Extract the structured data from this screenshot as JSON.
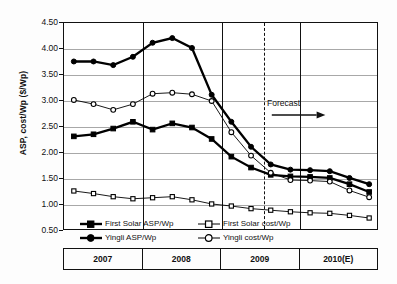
{
  "chart_data": {
    "type": "line",
    "title": "",
    "xlabel": "",
    "ylabel": "ASP, cost/Wp ($/Wp)",
    "ylim": [
      0.5,
      4.5
    ],
    "ytick_labels": [
      "0.50",
      "1.00",
      "1.50",
      "2.00",
      "2.50",
      "3.00",
      "3.50",
      "4.00",
      "4.50"
    ],
    "ytick_values": [
      0.5,
      1.0,
      1.5,
      2.0,
      2.5,
      3.0,
      3.5,
      4.0,
      4.5
    ],
    "grid": true,
    "legend_position": "bottom-inside",
    "x_group_labels": [
      "2007",
      "2008",
      "2009",
      "2010(E)"
    ],
    "x": [
      "2007Q1",
      "2007Q2",
      "2007Q3",
      "2007Q4",
      "2008Q1",
      "2008Q2",
      "2008Q3",
      "2008Q4",
      "2009Q1",
      "2009Q2",
      "2009Q3",
      "2009Q4",
      "2010Q1",
      "2010Q2",
      "2010Q3",
      "2010Q4"
    ],
    "annotations": [
      {
        "text": "Forecast",
        "type": "forecast-divider-arrow",
        "at_x": "2009Q4/2010Q1 boundary"
      }
    ],
    "series": [
      {
        "name": "First Solar ASP/Wp",
        "marker": "filled-square",
        "line": "thick-solid",
        "color": "#000000",
        "values": [
          2.32,
          2.36,
          2.47,
          2.6,
          2.45,
          2.57,
          2.49,
          2.27,
          1.93,
          1.72,
          1.58,
          1.55,
          1.54,
          1.52,
          1.4,
          1.25
        ]
      },
      {
        "name": "First Solar cost/Wp",
        "marker": "open-square",
        "line": "thin-solid",
        "color": "#000000",
        "values": [
          1.27,
          1.22,
          1.16,
          1.12,
          1.14,
          1.16,
          1.1,
          1.02,
          0.98,
          0.93,
          0.9,
          0.87,
          0.85,
          0.84,
          0.8,
          0.75
        ]
      },
      {
        "name": "Yingli ASP/Wp",
        "marker": "filled-circle",
        "line": "thick-solid",
        "color": "#000000",
        "values": [
          3.76,
          3.76,
          3.69,
          3.85,
          4.12,
          4.21,
          4.02,
          3.12,
          2.6,
          2.12,
          1.78,
          1.68,
          1.67,
          1.65,
          1.52,
          1.4
        ]
      },
      {
        "name": "Yingli cost/Wp",
        "marker": "open-circle",
        "line": "thin-solid",
        "color": "#000000",
        "values": [
          3.02,
          2.94,
          2.83,
          2.94,
          3.14,
          3.16,
          3.13,
          3.0,
          2.4,
          1.95,
          1.62,
          1.48,
          1.47,
          1.45,
          1.28,
          1.15
        ]
      }
    ]
  },
  "axis": {
    "y_title": "ASP, cost/Wp ($/Wp)"
  },
  "forecast": {
    "label": "Forecast"
  },
  "legend": {
    "items": [
      {
        "label": "First Solar ASP/Wp"
      },
      {
        "label": "First Solar cost/Wp"
      },
      {
        "label": "Yingli ASP/Wp"
      },
      {
        "label": "Yingli cost/Wp"
      }
    ]
  }
}
